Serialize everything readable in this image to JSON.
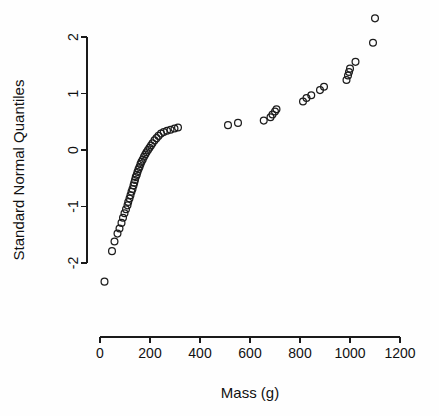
{
  "chart_data": {
    "type": "scatter",
    "title": "",
    "subtitle": "",
    "xlabel": "Mass (g)",
    "ylabel": "Standard Normal Quantiles",
    "xlim": [
      0,
      1250
    ],
    "ylim": [
      -2.45,
      2.45
    ],
    "xticks": [
      0,
      200,
      400,
      600,
      800,
      1000,
      1200
    ],
    "xticklabels": [
      "0",
      "200",
      "400",
      "600",
      "800",
      "1000",
      "1200"
    ],
    "yticks": [
      -2,
      -1,
      0,
      1,
      2
    ],
    "yticklabels": [
      "-2",
      "-1",
      "0",
      "1",
      "2"
    ],
    "grid": false,
    "legend": null,
    "marker": "open-circle",
    "marker_color": "#1c1c1c",
    "points": [
      {
        "x": 18,
        "y": -2.33
      },
      {
        "x": 48,
        "y": -1.79
      },
      {
        "x": 58,
        "y": -1.62
      },
      {
        "x": 70,
        "y": -1.48
      },
      {
        "x": 78,
        "y": -1.39
      },
      {
        "x": 86,
        "y": -1.29
      },
      {
        "x": 92,
        "y": -1.2
      },
      {
        "x": 98,
        "y": -1.12
      },
      {
        "x": 104,
        "y": -1.05
      },
      {
        "x": 110,
        "y": -0.98
      },
      {
        "x": 113,
        "y": -0.92
      },
      {
        "x": 118,
        "y": -0.86
      },
      {
        "x": 122,
        "y": -0.8
      },
      {
        "x": 126,
        "y": -0.74
      },
      {
        "x": 130,
        "y": -0.69
      },
      {
        "x": 134,
        "y": -0.63
      },
      {
        "x": 137,
        "y": -0.58
      },
      {
        "x": 140,
        "y": -0.53
      },
      {
        "x": 143,
        "y": -0.48
      },
      {
        "x": 147,
        "y": -0.44
      },
      {
        "x": 150,
        "y": -0.39
      },
      {
        "x": 154,
        "y": -0.34
      },
      {
        "x": 158,
        "y": -0.3
      },
      {
        "x": 162,
        "y": -0.25
      },
      {
        "x": 166,
        "y": -0.21
      },
      {
        "x": 171,
        "y": -0.17
      },
      {
        "x": 176,
        "y": -0.12
      },
      {
        "x": 181,
        "y": -0.08
      },
      {
        "x": 186,
        "y": -0.04
      },
      {
        "x": 192,
        "y": 0.0
      },
      {
        "x": 198,
        "y": 0.04
      },
      {
        "x": 204,
        "y": 0.08
      },
      {
        "x": 210,
        "y": 0.12
      },
      {
        "x": 218,
        "y": 0.17
      },
      {
        "x": 226,
        "y": 0.21
      },
      {
        "x": 234,
        "y": 0.25
      },
      {
        "x": 244,
        "y": 0.29
      },
      {
        "x": 255,
        "y": 0.32
      },
      {
        "x": 268,
        "y": 0.34
      },
      {
        "x": 282,
        "y": 0.36
      },
      {
        "x": 298,
        "y": 0.38
      },
      {
        "x": 312,
        "y": 0.4
      },
      {
        "x": 512,
        "y": 0.44
      },
      {
        "x": 552,
        "y": 0.48
      },
      {
        "x": 655,
        "y": 0.52
      },
      {
        "x": 682,
        "y": 0.58
      },
      {
        "x": 690,
        "y": 0.63
      },
      {
        "x": 700,
        "y": 0.68
      },
      {
        "x": 706,
        "y": 0.72
      },
      {
        "x": 812,
        "y": 0.86
      },
      {
        "x": 826,
        "y": 0.92
      },
      {
        "x": 845,
        "y": 0.97
      },
      {
        "x": 880,
        "y": 1.06
      },
      {
        "x": 896,
        "y": 1.12
      },
      {
        "x": 986,
        "y": 1.24
      },
      {
        "x": 992,
        "y": 1.32
      },
      {
        "x": 996,
        "y": 1.38
      },
      {
        "x": 1000,
        "y": 1.44
      },
      {
        "x": 1022,
        "y": 1.56
      },
      {
        "x": 1092,
        "y": 1.9
      },
      {
        "x": 1100,
        "y": 2.33
      }
    ]
  },
  "axes": {
    "y_title": "Standard Normal Quantiles",
    "x_title": "Mass (g)"
  }
}
